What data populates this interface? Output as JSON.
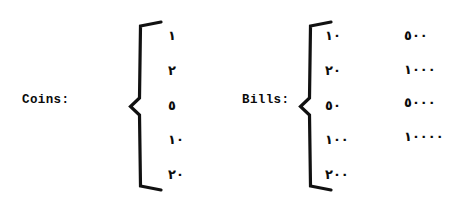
{
  "document": {
    "background_color": "#ffffff",
    "ink_color": "#0b0b0b"
  },
  "groups": [
    {
      "id": "coins",
      "label": "Coins:",
      "brace": "left-curly-brace",
      "columns": [
        {
          "id": "coins-denominations",
          "values": [
            "١",
            "٢",
            "٥",
            "١٠",
            "٢٠"
          ],
          "values_latin": [
            "1",
            "2",
            "5",
            "10",
            "20"
          ]
        }
      ]
    },
    {
      "id": "bills",
      "label": "Bills:",
      "brace": "left-curly-brace",
      "columns": [
        {
          "id": "bills-denominations-low",
          "values": [
            "١٠",
            "٢٠",
            "٥٠",
            "١٠٠",
            "٢٠٠"
          ],
          "values_latin": [
            "10",
            "20",
            "50",
            "100",
            "200"
          ]
        },
        {
          "id": "bills-denominations-high",
          "values": [
            "٥٠٠",
            "١٠٠٠",
            "٥٠٠٠",
            "١٠٠٠٠"
          ],
          "values_latin": [
            "500",
            "1000",
            "5000",
            "10000"
          ]
        }
      ]
    }
  ]
}
